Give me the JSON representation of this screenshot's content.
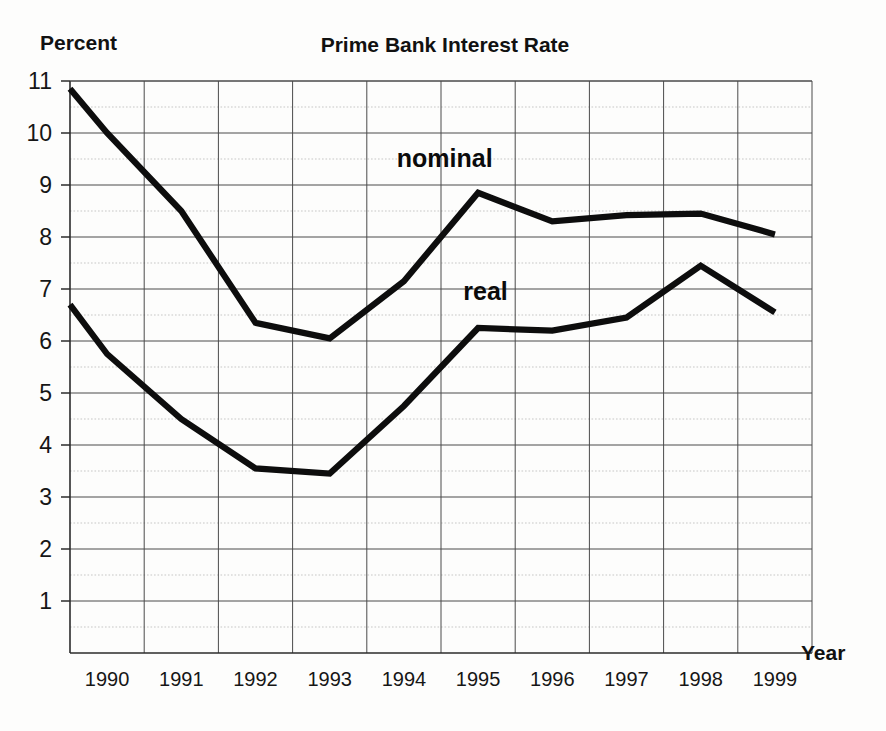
{
  "chart_data": {
    "type": "line",
    "title": "Prime Bank Interest Rate",
    "ylabel": "Percent",
    "xlabel": "Year",
    "categories": [
      "1990",
      "1991",
      "1992",
      "1993",
      "1994",
      "1995",
      "1996",
      "1997",
      "1998",
      "1999"
    ],
    "x": [
      1990,
      1991,
      1992,
      1993,
      1994,
      1995,
      1996,
      1997,
      1998,
      1999
    ],
    "ylim": [
      0,
      11
    ],
    "ytick_labels": [
      "11",
      "10",
      "9",
      "8",
      "7",
      "6",
      "5",
      "4",
      "3",
      "2",
      "1"
    ],
    "ytick_values": [
      11,
      10,
      9,
      8,
      7,
      6,
      5,
      4,
      3,
      2,
      1
    ],
    "minor_gridlines": true,
    "minor_grid_step": 0.5,
    "grid": true,
    "legend_position": "inline-annotations",
    "series": [
      {
        "name": "nominal",
        "label": "nominal",
        "label_x": 1994.55,
        "label_y": 9.35,
        "start_value": 10.85,
        "values": [
          10.0,
          8.5,
          6.35,
          6.05,
          7.15,
          8.85,
          8.3,
          8.42,
          8.45,
          8.05
        ]
      },
      {
        "name": "real",
        "label": "real",
        "label_x": 1995.1,
        "label_y": 6.78,
        "start_value": 6.7,
        "values": [
          5.75,
          4.5,
          3.55,
          3.45,
          4.75,
          6.25,
          6.2,
          6.45,
          7.45,
          6.55
        ]
      }
    ]
  }
}
